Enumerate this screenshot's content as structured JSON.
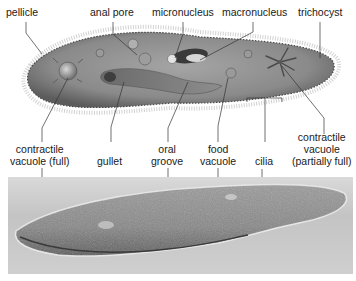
{
  "illustration": {
    "labels_top": [
      {
        "id": "pellicle",
        "text": "pellicle"
      },
      {
        "id": "anal-pore",
        "text": "anal pore"
      },
      {
        "id": "micronucleus",
        "text": "micronucleus"
      },
      {
        "id": "macronucleus",
        "text": "macronucleus"
      },
      {
        "id": "trichocyst",
        "text": "trichocyst"
      }
    ],
    "labels_bottom": [
      {
        "id": "contractile-vacuole-full",
        "line1": "contractile",
        "line2": "vacuole (full)"
      },
      {
        "id": "gullet",
        "text": "gullet"
      },
      {
        "id": "oral-groove",
        "line1": "oral",
        "line2": "groove"
      },
      {
        "id": "food-vacuole",
        "line1": "food",
        "line2": "vacuole"
      },
      {
        "id": "cilia",
        "text": "cilia"
      },
      {
        "id": "contractile-vacuole-partial",
        "line1": "contractile",
        "line2": "vacuole",
        "line3": "(partially full)"
      }
    ]
  },
  "colors": {
    "body_fill": "#8f8f8f",
    "body_edge": "#4a4a4a",
    "leader_line": "#333333",
    "photo_bg": "#cccccc",
    "photo_cell": "#8a8a8a"
  }
}
